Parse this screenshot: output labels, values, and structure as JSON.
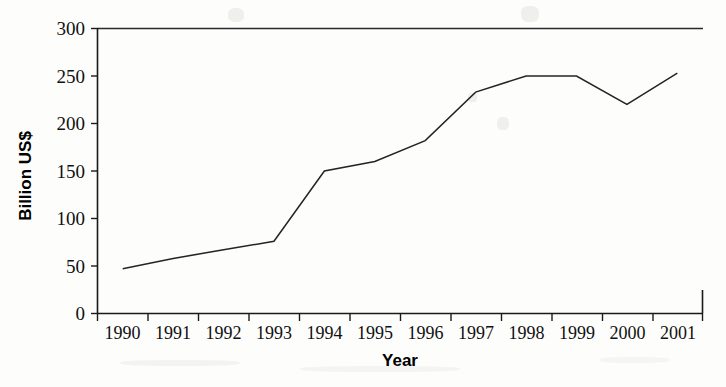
{
  "chart_data": {
    "type": "line",
    "title": "",
    "xlabel": "Year",
    "ylabel": "Billion US$",
    "categories": [
      "1990",
      "1991",
      "1992",
      "1993",
      "1994",
      "1995",
      "1996",
      "1997",
      "1998",
      "1999",
      "2000",
      "2001"
    ],
    "values": [
      47,
      58,
      67,
      76,
      150,
      160,
      182,
      233,
      250,
      250,
      220,
      253
    ],
    "series": [
      {
        "name": "Billion US$",
        "values": [
          47,
          58,
          67,
          76,
          150,
          160,
          182,
          233,
          250,
          250,
          220,
          253
        ]
      }
    ],
    "ylim": [
      0,
      300
    ],
    "yticks": [
      0,
      50,
      100,
      150,
      200,
      250,
      300
    ],
    "ytick_labels": [
      "0",
      "50",
      "100",
      "150",
      "200",
      "250",
      "300"
    ],
    "grid": false,
    "legend": false,
    "legend_position": "none",
    "line_color": "#242424"
  },
  "axes": {
    "y_title": "Billion US$",
    "x_title": "Year"
  }
}
